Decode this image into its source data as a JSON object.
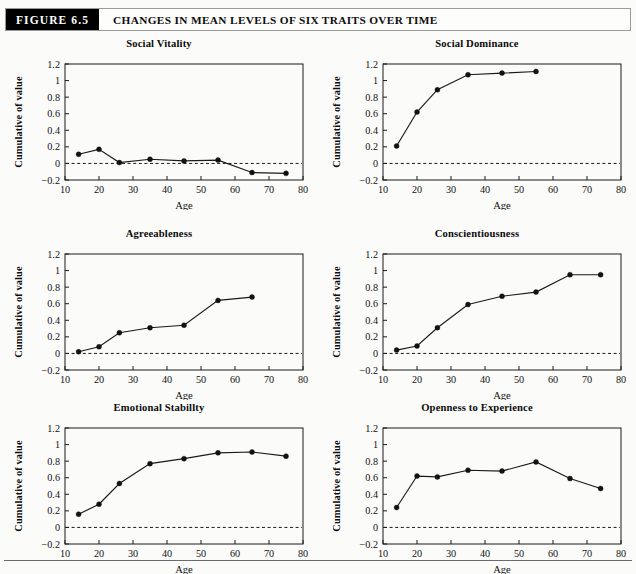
{
  "figure": {
    "tag": "FIGURE 6.5",
    "title": "CHANGES IN MEAN LEVELS OF SIX TRAITS OVER TIME",
    "tag_background": "#000000",
    "tag_color": "#ffffff",
    "page_background": "#fbfbfa",
    "ink_color": "#111111"
  },
  "axis_common": {
    "xlabel": "Age",
    "ylabel": "Cumulative of value",
    "xlim": [
      10,
      80
    ],
    "ylim": [
      -0.2,
      1.2
    ],
    "xticks": [
      10,
      20,
      30,
      40,
      50,
      60,
      70,
      80
    ],
    "xtick_labels": [
      "10",
      "20",
      "30",
      "40",
      "50",
      "60",
      "70",
      "80"
    ],
    "yticks": [
      -0.2,
      0,
      0.2,
      0.4,
      0.6,
      0.8,
      1,
      1.2
    ],
    "ytick_labels": [
      "−0.2",
      "0",
      "0.2",
      "0.4",
      "0.6",
      "0.8",
      "1",
      "1.2"
    ],
    "zero_reference": 0,
    "grid": false,
    "legend": "none"
  },
  "chart_data": [
    {
      "type": "line",
      "title": "Social Vitality",
      "xlabel": "Age",
      "ylabel": "Cumulative of value",
      "xlim": [
        10,
        80
      ],
      "ylim": [
        -0.2,
        1.2
      ],
      "x": [
        14,
        20,
        26,
        35,
        45,
        55,
        65,
        75
      ],
      "values": [
        0.11,
        0.17,
        0.01,
        0.05,
        0.03,
        0.04,
        -0.11,
        -0.12
      ]
    },
    {
      "type": "line",
      "title": "Social Dominance",
      "xlabel": "Age",
      "ylabel": "Cumulative of value",
      "xlim": [
        10,
        80
      ],
      "ylim": [
        -0.2,
        1.2
      ],
      "x": [
        14,
        20,
        26,
        35,
        45,
        55
      ],
      "values": [
        0.21,
        0.62,
        0.89,
        1.07,
        1.09,
        1.11
      ]
    },
    {
      "type": "line",
      "title": "Agreeableness",
      "xlabel": "Age",
      "ylabel": "Cumulative of value",
      "xlim": [
        10,
        80
      ],
      "ylim": [
        -0.2,
        1.2
      ],
      "x": [
        14,
        20,
        26,
        35,
        45,
        55,
        65
      ],
      "values": [
        0.02,
        0.08,
        0.25,
        0.31,
        0.34,
        0.64,
        0.68
      ]
    },
    {
      "type": "line",
      "title": "Conscientiousness",
      "xlabel": "Age",
      "ylabel": "Cumulative of value",
      "xlim": [
        10,
        80
      ],
      "ylim": [
        -0.2,
        1.2
      ],
      "x": [
        14,
        20,
        26,
        35,
        45,
        55,
        65,
        74
      ],
      "values": [
        0.04,
        0.09,
        0.31,
        0.59,
        0.69,
        0.74,
        0.95,
        0.95
      ]
    },
    {
      "type": "line",
      "title": "Emotional Stabillty",
      "xlabel": "Age",
      "ylabel": "Cumulative of value",
      "xlim": [
        10,
        80
      ],
      "ylim": [
        -0.2,
        1.2
      ],
      "x": [
        14,
        20,
        26,
        35,
        45,
        55,
        65,
        75
      ],
      "values": [
        0.16,
        0.28,
        0.53,
        0.77,
        0.83,
        0.9,
        0.91,
        0.86
      ]
    },
    {
      "type": "line",
      "title": "Openness to Experience",
      "xlabel": "Age",
      "ylabel": "Cumulative of value",
      "xlim": [
        10,
        80
      ],
      "ylim": [
        -0.2,
        1.2
      ],
      "x": [
        14,
        20,
        26,
        35,
        45,
        55,
        65,
        74
      ],
      "values": [
        0.24,
        0.62,
        0.61,
        0.69,
        0.68,
        0.79,
        0.59,
        0.47
      ]
    }
  ]
}
